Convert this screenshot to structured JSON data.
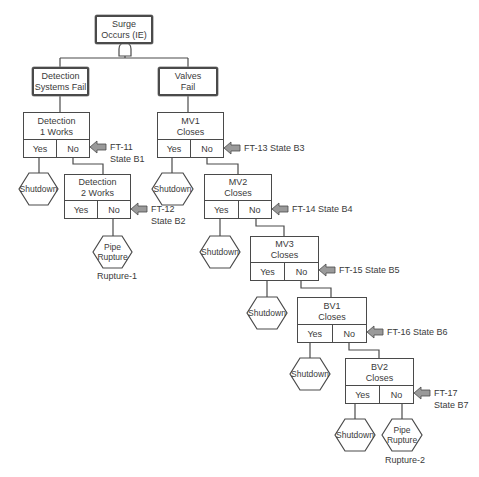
{
  "diagram": {
    "type": "event tree / fault tree",
    "colors": {
      "line": "#4a4a4a",
      "arrow_fill": "#9a9a9a",
      "text": "#3a3a3a"
    },
    "top_event": {
      "label_line1": "Surge",
      "label_line2": "Occurs (IE)",
      "gate": "AND"
    },
    "branches": {
      "detection": {
        "line1": "Detection",
        "line2": "Systems Fail"
      },
      "valves": {
        "line1": "Valves",
        "line2": "Fail"
      }
    },
    "nodes": [
      {
        "id": "det1",
        "line1": "Detection",
        "line2": "1 Works",
        "yes": "Yes",
        "no": "No",
        "ref_line1": "FT-11",
        "ref_line2": "State B1"
      },
      {
        "id": "det2",
        "line1": "Detection",
        "line2": "2 Works",
        "yes": "Yes",
        "no": "No",
        "ref_line1": "FT-12",
        "ref_line2": "State B2"
      },
      {
        "id": "mv1",
        "line1": "MV1",
        "line2": "Closes",
        "yes": "Yes",
        "no": "No",
        "ref_line1": "FT-13 State B3",
        "ref_line2": ""
      },
      {
        "id": "mv2",
        "line1": "MV2",
        "line2": "Closes",
        "yes": "Yes",
        "no": "No",
        "ref_line1": "FT-14 State B4",
        "ref_line2": ""
      },
      {
        "id": "mv3",
        "line1": "MV3",
        "line2": "Closes",
        "yes": "Yes",
        "no": "No",
        "ref_line1": "FT-15 State B5",
        "ref_line2": ""
      },
      {
        "id": "bv1",
        "line1": "BV1",
        "line2": "Closes",
        "yes": "Yes",
        "no": "No",
        "ref_line1": "FT-16 State B6",
        "ref_line2": ""
      },
      {
        "id": "bv2",
        "line1": "BV2",
        "line2": "Closes",
        "yes": "Yes",
        "no": "No",
        "ref_line1": "FT-17",
        "ref_line2": "State B7"
      }
    ],
    "outcomes": {
      "shutdown": "Shutdown",
      "pipe_rupture_line1": "Pipe",
      "pipe_rupture_line2": "Rupture",
      "rupture1_label": "Rupture-1",
      "rupture2_label": "Rupture-2"
    }
  }
}
